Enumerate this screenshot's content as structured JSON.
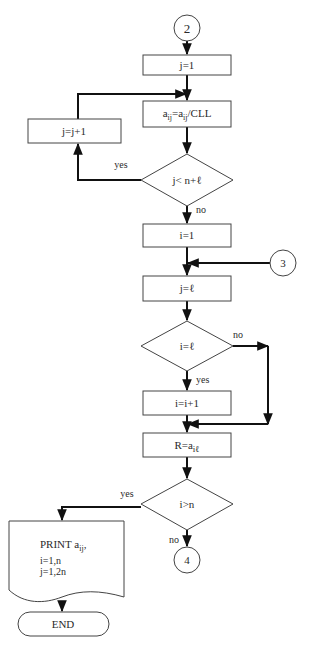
{
  "diagram": {
    "type": "flowchart",
    "connectors": {
      "start": "2",
      "entry_3": "3",
      "exit_4": "4"
    },
    "processes": {
      "init_j": "j=1",
      "normalize": {
        "base": "a",
        "sub": "ij",
        "eq": "=",
        "base2": "a",
        "sub2": "ij",
        "tail": "/CLL"
      },
      "increment_j": "j=j+1",
      "init_i": "i=1",
      "set_j": "j=ℓ",
      "increment_i": "i=i+1",
      "assign_r": {
        "pre": "R=a",
        "sub": "iℓ"
      }
    },
    "decisions": {
      "loop_j": "j< n+ℓ",
      "check_i": "i=ℓ",
      "end_check": "i>n"
    },
    "labels": {
      "loop_j_yes": "yes",
      "loop_j_no": "no",
      "check_i_no": "no",
      "check_i_yes": "yes",
      "end_yes": "yes",
      "end_no": "no"
    },
    "output": {
      "title_pre": "PRINT a",
      "title_sub": "ij",
      "title_post": ",",
      "line1": "i=1,n",
      "line2": "j=1,2n"
    },
    "terminal": "END"
  }
}
